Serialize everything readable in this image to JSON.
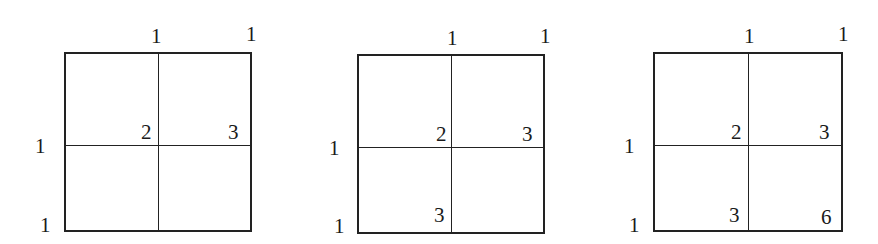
{
  "diagrams": [
    {
      "top_labels": [
        "1",
        "1"
      ],
      "left_labels": [
        "1",
        "1"
      ],
      "cells": {
        "center": "2",
        "right_mid": "3",
        "bottom_mid": "",
        "bottom_right": ""
      }
    },
    {
      "top_labels": [
        "1",
        "1"
      ],
      "left_labels": [
        "1",
        "1"
      ],
      "cells": {
        "center": "2",
        "right_mid": "3",
        "bottom_mid": "3",
        "bottom_right": ""
      }
    },
    {
      "top_labels": [
        "1",
        "1"
      ],
      "left_labels": [
        "1",
        "1"
      ],
      "cells": {
        "center": "2",
        "right_mid": "3",
        "bottom_mid": "3",
        "bottom_right": "6"
      }
    }
  ]
}
